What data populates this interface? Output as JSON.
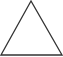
{
  "shape": {
    "type": "triangle",
    "icon": "triangle-outline-icon",
    "stroke_color": "#333333",
    "fill_color": "#ffffff",
    "background": "#ffffff"
  }
}
